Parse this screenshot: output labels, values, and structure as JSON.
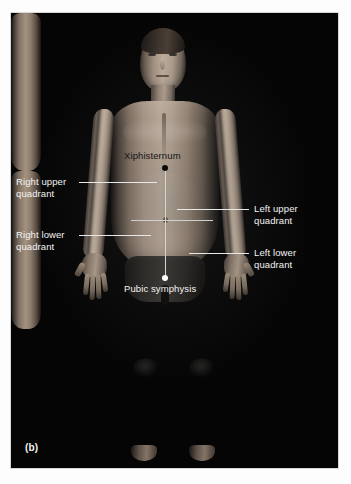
{
  "figure": {
    "panel_caption": "(b)",
    "colors": {
      "background": "#ffffff",
      "panel": "#050505",
      "label_light": "#f3f3f3",
      "label_dark": "#141414",
      "leader_light": "#e8e8e8",
      "leader_dark": "#1a1a1a",
      "marker_black": "#0a0a0a",
      "marker_white": "#ffffff"
    }
  },
  "annotations": {
    "right_upper_quadrant": {
      "label": "Right upper\nquadrant",
      "tone": "light"
    },
    "right_lower_quadrant": {
      "label": "Right lower\nquadrant",
      "tone": "light"
    },
    "left_upper_quadrant": {
      "label": "Left upper\nquadrant",
      "tone": "light"
    },
    "left_lower_quadrant": {
      "label": "Left lower\nquadrant",
      "tone": "light"
    },
    "xiphisternum": {
      "label": "Xiphisternum",
      "tone": "dark",
      "marker": "black-dot"
    },
    "pubic_symphysis": {
      "label": "Pubic symphysis",
      "tone": "light",
      "marker": "white-dot"
    }
  },
  "subject": {
    "description": "Anterior view of standing male torso and body used to illustrate abdominal quadrants",
    "parts": [
      "head",
      "neck",
      "torso",
      "left-arm",
      "right-arm",
      "left-hand",
      "right-hand",
      "shorts",
      "left-leg",
      "right-leg",
      "left-foot",
      "right-foot"
    ]
  }
}
